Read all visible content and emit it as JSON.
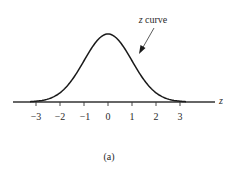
{
  "chart_data": {
    "type": "line",
    "title": "",
    "subtitle": "",
    "xlabel": "z",
    "ylabel": "",
    "xlim": [
      -3.9,
      4.3
    ],
    "ylim": [
      0,
      0.42
    ],
    "grid": false,
    "legend": null,
    "x_ticks": [
      -3,
      -2,
      -1,
      0,
      1,
      2,
      3
    ],
    "x_tick_labels": [
      "−3",
      "−2",
      "−1",
      "0",
      "1",
      "2",
      "3"
    ],
    "series": [
      {
        "name": "z curve",
        "description": "standard normal density curve",
        "x": [
          -3.5,
          -3,
          -2.5,
          -2,
          -1.5,
          -1,
          -0.5,
          0,
          0.5,
          1,
          1.5,
          2,
          2.5,
          3,
          3.5
        ],
        "values": [
          0.0009,
          0.0044,
          0.0175,
          0.054,
          0.1295,
          0.242,
          0.3521,
          0.3989,
          0.3521,
          0.242,
          0.1295,
          0.054,
          0.0175,
          0.0044,
          0.0009
        ]
      }
    ],
    "annotations": [
      {
        "text_italic": "z",
        "text": " curve",
        "points_to": "right side of curve near z ≈ 1.3"
      }
    ],
    "caption": "(a)"
  },
  "labels": {
    "axis_variable": "z",
    "annotation_var": "z",
    "annotation_rest": " curve",
    "caption": "(a)",
    "ticks": [
      "−3",
      "−2",
      "−1",
      "0",
      "1",
      "2",
      "3"
    ]
  },
  "colors": {
    "line": "#1a1a1a",
    "axis": "#333333",
    "text": "#2a2a2a",
    "background": "#ffffff"
  }
}
